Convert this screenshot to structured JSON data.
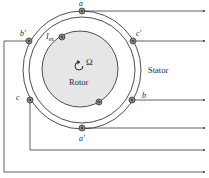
{
  "diagram": {
    "type": "synchronous-machine-cross-section",
    "labels": {
      "stator": "Stator",
      "rotor": "Rotor",
      "omega": "Ω",
      "excitation_current": "I",
      "excitation_subscript": "ex"
    },
    "conductors": [
      {
        "id": "a",
        "label": "a"
      },
      {
        "id": "a_prime",
        "label": "a′"
      },
      {
        "id": "b",
        "label": "b"
      },
      {
        "id": "b_prime",
        "label": "b′"
      },
      {
        "id": "c",
        "label": "c"
      },
      {
        "id": "c_prime",
        "label": "c′"
      }
    ],
    "colors": {
      "line": "#3a3a3a",
      "rotor_fill": "#e6e6e6",
      "conductor_fill": "#8a8a8a",
      "background": "#ffffff"
    }
  }
}
